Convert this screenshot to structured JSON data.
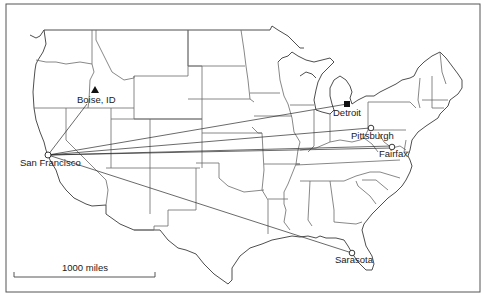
{
  "figure": {
    "type": "route-map",
    "region": "Continental United States",
    "origin": "San Francisco",
    "colors": {
      "line": "#2a2a2a",
      "boundary": "#6a6a6a",
      "background": "#ffffff"
    }
  },
  "cities": [
    {
      "id": "sanfrancisco",
      "label": "San Francisco",
      "marker": "open-circle",
      "x": 48,
      "y": 155
    },
    {
      "id": "boise",
      "label": "Boise, ID",
      "marker": "filled-triangle",
      "x": 95,
      "y": 90
    },
    {
      "id": "detroit",
      "label": "Detroit",
      "marker": "filled-square",
      "x": 347,
      "y": 104
    },
    {
      "id": "pittsburgh",
      "label": "Pittsburgh",
      "marker": "open-circle",
      "x": 370,
      "y": 128
    },
    {
      "id": "fairfax",
      "label": "Fairfax",
      "marker": "open-circle",
      "x": 392,
      "y": 148
    },
    {
      "id": "sarasota",
      "label": "Sarasota",
      "marker": "open-circle",
      "x": 352,
      "y": 253
    }
  ],
  "routes": [
    {
      "from": "San Francisco",
      "to": "Boise, ID"
    },
    {
      "from": "San Francisco",
      "to": "Detroit"
    },
    {
      "from": "San Francisco",
      "to": "Pittsburgh"
    },
    {
      "from": "San Francisco",
      "to": "Fairfax"
    },
    {
      "from": "San Francisco",
      "to": "Sarasota"
    }
  ],
  "scale_bar": {
    "label": "1000 miles"
  }
}
